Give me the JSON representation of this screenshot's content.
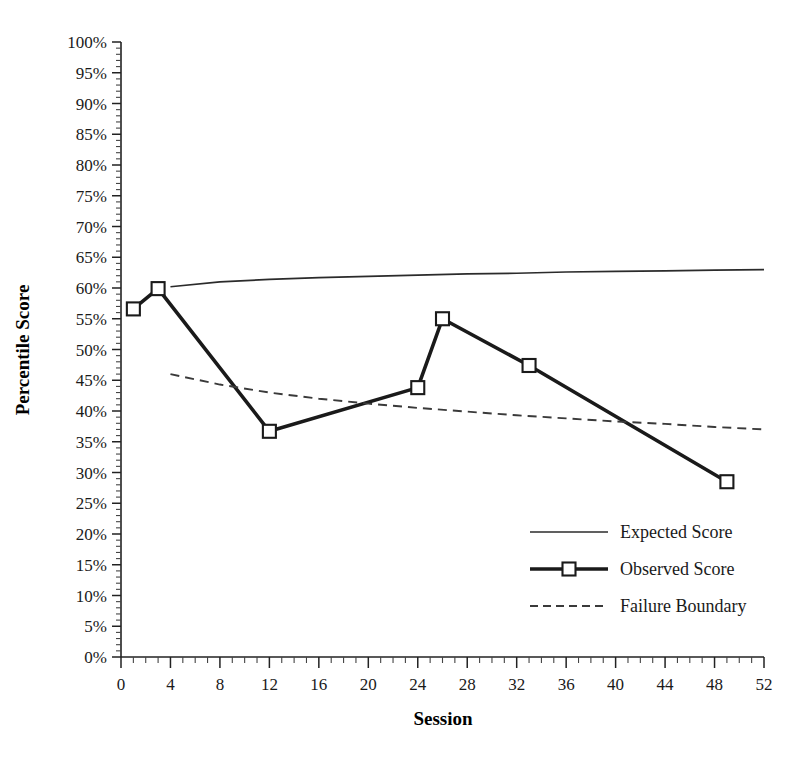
{
  "chart_data": {
    "type": "line",
    "title": "",
    "xlabel": "Session",
    "ylabel": "Percentile Score",
    "xlim": [
      0,
      52
    ],
    "ylim": [
      0,
      100
    ],
    "grid": false,
    "legend_position": "inside-lower-right",
    "x_tick_labels": [
      "0",
      "4",
      "8",
      "12",
      "16",
      "20",
      "24",
      "28",
      "32",
      "36",
      "40",
      "44",
      "48",
      "52"
    ],
    "x_tick_values": [
      0,
      4,
      8,
      12,
      16,
      20,
      24,
      28,
      32,
      36,
      40,
      44,
      48,
      52
    ],
    "x_minor_tick_interval": 1,
    "y_tick_labels": [
      "0%",
      "5%",
      "10%",
      "15%",
      "20%",
      "25%",
      "30%",
      "35%",
      "40%",
      "45%",
      "50%",
      "55%",
      "60%",
      "65%",
      "70%",
      "75%",
      "80%",
      "85%",
      "90%",
      "95%",
      "100%"
    ],
    "y_tick_values": [
      0,
      5,
      10,
      15,
      20,
      25,
      30,
      35,
      40,
      45,
      50,
      55,
      60,
      65,
      70,
      75,
      80,
      85,
      90,
      95,
      100
    ],
    "y_minor_tick_interval": 1,
    "series": [
      {
        "name": "Expected Score",
        "style": "solid-thin",
        "marker": "none",
        "color": "#2b2b2b",
        "points": [
          {
            "x": 4,
            "y": 60.2
          },
          {
            "x": 8,
            "y": 61.0
          },
          {
            "x": 12,
            "y": 61.4
          },
          {
            "x": 16,
            "y": 61.7
          },
          {
            "x": 20,
            "y": 61.9
          },
          {
            "x": 24,
            "y": 62.1
          },
          {
            "x": 28,
            "y": 62.3
          },
          {
            "x": 32,
            "y": 62.4
          },
          {
            "x": 36,
            "y": 62.6
          },
          {
            "x": 40,
            "y": 62.7
          },
          {
            "x": 44,
            "y": 62.8
          },
          {
            "x": 48,
            "y": 62.9
          },
          {
            "x": 52,
            "y": 63.0
          }
        ]
      },
      {
        "name": "Observed Score",
        "style": "solid-thick",
        "marker": "open-square",
        "color": "#1a1a1a",
        "points": [
          {
            "x": 1,
            "y": 56.6
          },
          {
            "x": 3,
            "y": 59.9
          },
          {
            "x": 12,
            "y": 36.7
          },
          {
            "x": 24,
            "y": 43.8
          },
          {
            "x": 26,
            "y": 55.0
          },
          {
            "x": 33,
            "y": 47.4
          },
          {
            "x": 49,
            "y": 28.5
          }
        ]
      },
      {
        "name": "Failure Boundary",
        "style": "dashed",
        "marker": "none",
        "color": "#3a3a3a",
        "points": [
          {
            "x": 4,
            "y": 46.0
          },
          {
            "x": 8,
            "y": 44.3
          },
          {
            "x": 12,
            "y": 43.0
          },
          {
            "x": 16,
            "y": 42.0
          },
          {
            "x": 20,
            "y": 41.2
          },
          {
            "x": 24,
            "y": 40.5
          },
          {
            "x": 28,
            "y": 39.9
          },
          {
            "x": 32,
            "y": 39.3
          },
          {
            "x": 36,
            "y": 38.8
          },
          {
            "x": 40,
            "y": 38.3
          },
          {
            "x": 44,
            "y": 37.9
          },
          {
            "x": 48,
            "y": 37.4
          },
          {
            "x": 52,
            "y": 37.0
          }
        ]
      }
    ]
  },
  "legend": {
    "items": [
      {
        "label": "Expected Score"
      },
      {
        "label": "Observed Score"
      },
      {
        "label": "Failure Boundary"
      }
    ]
  },
  "colors": {
    "axis": "#222222",
    "expected": "#2b2b2b",
    "observed": "#1a1a1a",
    "failure": "#3a3a3a",
    "background": "#ffffff"
  }
}
